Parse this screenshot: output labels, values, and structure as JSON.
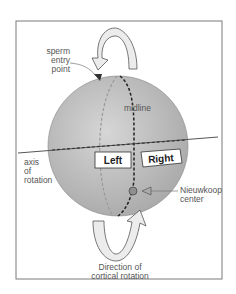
{
  "labels": {
    "sperm_entry": [
      "sperm",
      "entry",
      "point"
    ],
    "midline": "midline",
    "axis": [
      "axis",
      "of",
      "rotation"
    ],
    "left": "Left",
    "right": "Right",
    "nieuwkoop": [
      "Nieuwkoop",
      "center"
    ],
    "direction": [
      "Direction of",
      "cortical rotation"
    ]
  },
  "colors": {
    "sphere": "#bdbdbd",
    "frame": "#7a7a7a",
    "arrow_fill": "#ececec",
    "nieuwkoop_dot": "#8f8f8f"
  }
}
